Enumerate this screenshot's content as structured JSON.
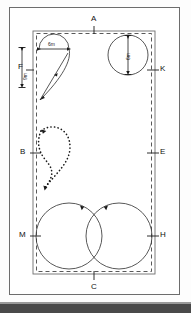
{
  "figure": {
    "type": "field-turning-pattern-diagram",
    "title": "",
    "background_color": "#ffffff",
    "line_color": "#3a3a3a",
    "frame_color": "#6d6d6d"
  },
  "field": {
    "outer_boundary": {
      "style": "solid",
      "label": "field boundary"
    },
    "inner_boundary": {
      "style": "dashed",
      "label": "headland boundary"
    }
  },
  "point_labels": {
    "top": "A",
    "bottom": "C",
    "left_upper": "F",
    "left_middle": "B",
    "left_lower": "M",
    "right_upper": "K",
    "right_middle": "E",
    "right_lower": "H"
  },
  "dimensions": {
    "top_left_width": "6m",
    "left_height": "9m",
    "top_right_circle": "6m"
  },
  "paths": [
    {
      "name": "semicircle-triangle-turn",
      "style": "solid",
      "arrows": 3
    },
    {
      "name": "dotted-teardrop-loop",
      "style": "dotted",
      "arrows": 2
    },
    {
      "name": "tangent-circle-left",
      "style": "solid",
      "arrows": 1
    },
    {
      "name": "tangent-circle-right",
      "style": "solid",
      "arrows": 1
    },
    {
      "name": "top-right-circle",
      "style": "solid",
      "arrows": 0
    }
  ]
}
